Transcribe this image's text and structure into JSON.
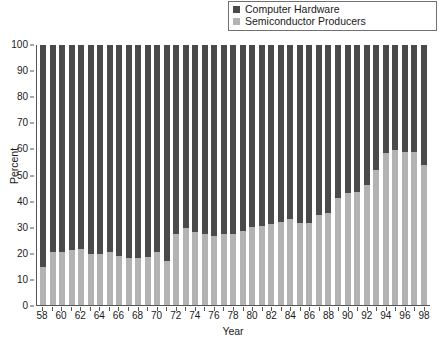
{
  "legend": {
    "position": "top-right",
    "entries": [
      {
        "label": "Computer Hardware",
        "color": "#4a4a4a",
        "icon": "square-swatch-icon"
      },
      {
        "label": "Semiconductor Producers",
        "color": "#b3b3b3",
        "icon": "square-swatch-icon"
      }
    ]
  },
  "chart_data": {
    "type": "bar",
    "stacked": true,
    "title": "",
    "subtitle": "",
    "xlabel": "Year",
    "ylabel": "Percent",
    "ylim": [
      0,
      100
    ],
    "xlim_labels": [
      "58",
      "98"
    ],
    "grid": false,
    "legend_position": "top-right",
    "ytick_labels": [
      "0",
      "10",
      "20",
      "30",
      "40",
      "50",
      "60",
      "70",
      "80",
      "90",
      "100"
    ],
    "ytick_values": [
      0,
      10,
      20,
      30,
      40,
      50,
      60,
      70,
      80,
      90,
      100
    ],
    "xtick_labels": [
      "58",
      "60",
      "62",
      "64",
      "66",
      "68",
      "70",
      "72",
      "74",
      "76",
      "78",
      "80",
      "82",
      "84",
      "86",
      "88",
      "90",
      "92",
      "94",
      "96",
      "98"
    ],
    "categories": [
      "58",
      "59",
      "60",
      "61",
      "62",
      "63",
      "64",
      "65",
      "66",
      "67",
      "68",
      "69",
      "70",
      "71",
      "72",
      "73",
      "74",
      "75",
      "76",
      "77",
      "78",
      "79",
      "80",
      "81",
      "82",
      "83",
      "84",
      "85",
      "86",
      "87",
      "88",
      "89",
      "90",
      "91",
      "92",
      "93",
      "94",
      "95",
      "96",
      "97",
      "98"
    ],
    "series": [
      {
        "name": "Semiconductor Producers",
        "color": "#b3b3b3",
        "values": [
          14.5,
          20.5,
          20.5,
          21.0,
          21.5,
          19.5,
          19.5,
          20.5,
          19.0,
          18.0,
          18.0,
          18.5,
          20.5,
          17.0,
          27.5,
          29.5,
          28.0,
          27.5,
          26.5,
          27.5,
          27.5,
          28.5,
          30.0,
          30.5,
          31.0,
          32.0,
          33.0,
          31.5,
          31.5,
          34.5,
          35.5,
          41.0,
          43.0,
          43.5,
          46.0,
          52.0,
          58.5,
          59.5,
          59.0,
          59.0,
          54.0
        ]
      },
      {
        "name": "Computer Hardware",
        "color": "#4a4a4a",
        "values": [
          85.5,
          79.5,
          79.5,
          79.0,
          78.5,
          80.5,
          80.5,
          79.5,
          81.0,
          82.0,
          82.0,
          81.5,
          79.5,
          83.0,
          72.5,
          70.5,
          72.0,
          72.5,
          73.5,
          72.5,
          72.5,
          71.5,
          70.0,
          69.5,
          69.0,
          68.0,
          67.0,
          68.5,
          68.5,
          65.5,
          64.5,
          59.0,
          57.0,
          56.5,
          54.0,
          48.0,
          41.5,
          40.5,
          41.0,
          41.0,
          46.0
        ]
      }
    ]
  }
}
